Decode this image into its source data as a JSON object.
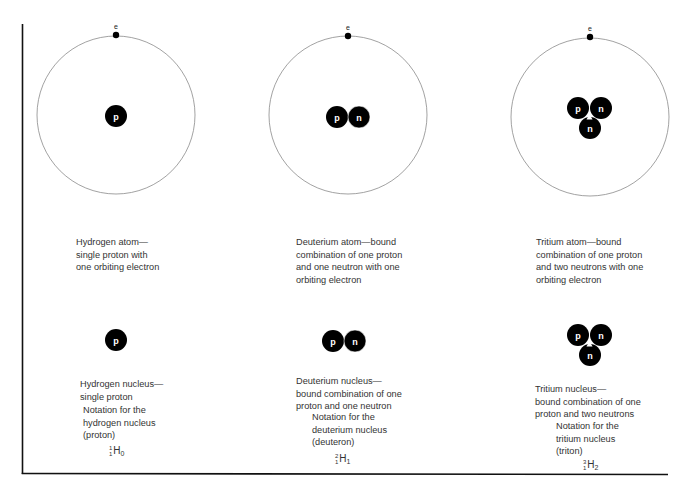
{
  "colors": {
    "background": "#ffffff",
    "ink": "#000000",
    "orbit": "#8a8a8a",
    "text": "#333333",
    "particle_label": "#ffffff"
  },
  "particle_labels": {
    "proton": "p",
    "neutron": "n",
    "electron": "e"
  },
  "atoms": [
    {
      "name": "hydrogen",
      "electron_label": "e",
      "nucleus": [
        "p"
      ],
      "caption": "Hydrogen atom—\nsingle proton with\none orbiting electron"
    },
    {
      "name": "deuterium",
      "electron_label": "e",
      "nucleus": [
        "p",
        "n"
      ],
      "caption": "Deuterium atom—bound\ncombination of one proton\nand one neutron with one\norbiting electron"
    },
    {
      "name": "tritium",
      "electron_label": "e",
      "nucleus": [
        "p",
        "n",
        "n"
      ],
      "caption": "Tritium atom—bound\ncombination of one proton\nand two neutrons with one\norbiting electron"
    }
  ],
  "nuclei": [
    {
      "name": "hydrogen",
      "particles": [
        "p"
      ],
      "caption": "Hydrogen nucleus—\nsingle proton",
      "notation_label": "Notation for the\nhydrogen nucleus\n(proton)",
      "symbol": {
        "mass_number": "1",
        "atomic_number": "1",
        "element": "H",
        "neutrons": "0"
      }
    },
    {
      "name": "deuterium",
      "particles": [
        "p",
        "n"
      ],
      "caption": "Deuterium nucleus—\nbound combination of one\nproton and one neutron",
      "notation_label": "Notation for the\ndeuterium nucleus\n(deuteron)",
      "symbol": {
        "mass_number": "2",
        "atomic_number": "1",
        "element": "H",
        "neutrons": "1"
      }
    },
    {
      "name": "tritium",
      "particles": [
        "p",
        "n",
        "n"
      ],
      "caption": "Tritium nucleus—\nbound combination of one\nproton and two neutrons",
      "notation_label": "Notation for the\ntritium nucleus\n(triton)",
      "symbol": {
        "mass_number": "3",
        "atomic_number": "1",
        "element": "H",
        "neutrons": "2"
      }
    }
  ]
}
